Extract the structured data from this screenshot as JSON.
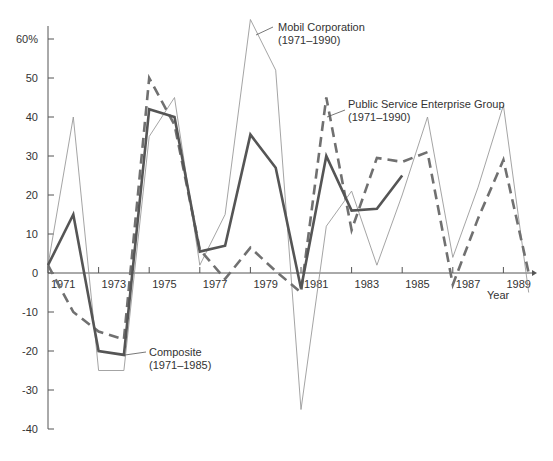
{
  "chart_data": {
    "type": "line",
    "title": "",
    "xlabel": "Year",
    "ylabel": "",
    "ylim": [
      -40,
      65
    ],
    "xlim": [
      1971,
      1990
    ],
    "grid": false,
    "y_ticks": [
      60,
      50,
      40,
      30,
      20,
      10,
      0,
      -10,
      -20,
      -30,
      -40
    ],
    "y_tick_labels": [
      "60%",
      "50",
      "40",
      "30",
      "20",
      "10",
      "0",
      "-10",
      "-20",
      "-30",
      "-40"
    ],
    "x_ticks": [
      1971,
      1973,
      1975,
      1977,
      1979,
      1981,
      1983,
      1985,
      1987,
      1989
    ],
    "x": [
      1971,
      1972,
      1973,
      1974,
      1975,
      1976,
      1977,
      1978,
      1979,
      1980,
      1981,
      1982,
      1983,
      1984,
      1985,
      1986,
      1987,
      1988,
      1989,
      1990
    ],
    "series": [
      {
        "name": "Mobil Corporation (1971–1990)",
        "style": "thin-solid",
        "color": "#9a9a9a",
        "values": [
          2,
          40,
          -25,
          -25,
          35,
          45,
          2,
          15,
          65,
          52,
          -35,
          12,
          21,
          2,
          20,
          40,
          4,
          22,
          43,
          -5
        ]
      },
      {
        "name": "Public Service Enterprise Group (1971–1990)",
        "style": "dashed",
        "color": "#707070",
        "values": [
          2,
          -10,
          -15,
          -17,
          50,
          38,
          6,
          -1.5,
          6.5,
          0.5,
          -5,
          45,
          11,
          29.5,
          28.5,
          31,
          -3,
          14,
          29,
          0
        ]
      },
      {
        "name": "Composite (1971–1985)",
        "style": "thick-solid",
        "color": "#555555",
        "values": [
          2,
          15,
          -20,
          -21,
          42,
          40,
          5.5,
          7,
          35.5,
          27,
          -4,
          30,
          16,
          16.5,
          25,
          null,
          null,
          null,
          null,
          null
        ]
      }
    ],
    "annotations": [
      {
        "text_line1": "Mobil Corporation",
        "text_line2": "(1971–1990)"
      },
      {
        "text_line1": "Public Service Enterprise Group",
        "text_line2": "(1971–1990)"
      },
      {
        "text_line1": "Composite",
        "text_line2": "(1971–1985)"
      }
    ]
  }
}
